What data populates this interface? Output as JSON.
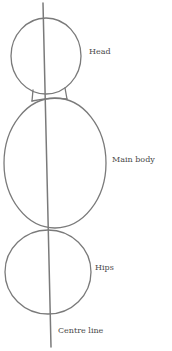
{
  "diagram": {
    "stroke_color": "#7a7a7a",
    "labels": {
      "head": "Head",
      "main_body": "Main body",
      "hips": "Hips",
      "centre_line": "Centre line"
    }
  }
}
